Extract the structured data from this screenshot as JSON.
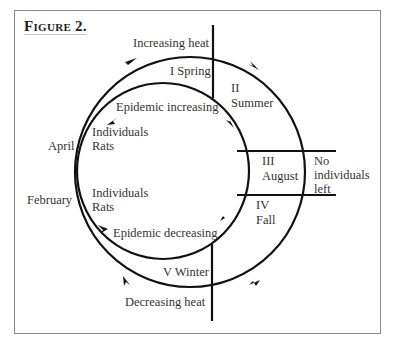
{
  "figure": {
    "title": "Figure 2.",
    "labels": {
      "increasing_heat": "Increasing heat",
      "decreasing_heat": "Decreasing heat",
      "spring": "I  Spring",
      "summer_num": "II",
      "summer": "Summer",
      "august_num": "III",
      "august": "August",
      "no_individuals_1": "No",
      "no_individuals_2": "individuals",
      "no_individuals_3": "left",
      "fall_num": "IV",
      "fall": "Fall",
      "winter": "V  Winter",
      "epidemic_increasing": "Epidemic increasing",
      "epidemic_decreasing": "Epidemic decreasing",
      "april": "April",
      "february": "February",
      "individuals_upper": "Individuals",
      "rats_upper": "Rats",
      "individuals_lower": "Individuals",
      "rats_lower": "Rats"
    },
    "colors": {
      "line": "#111111",
      "text": "#333333",
      "frame": "#8a8a8a"
    }
  }
}
